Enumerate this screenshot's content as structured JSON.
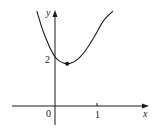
{
  "chart_data": {
    "type": "line",
    "title": "",
    "xlabel": "x",
    "ylabel": "y",
    "x_ticks": [
      {
        "value": 0,
        "label": "0"
      },
      {
        "value": 1,
        "label": "1"
      }
    ],
    "y_ticks": [
      {
        "value": 2,
        "label": "2"
      }
    ],
    "xlim": [
      -1.0,
      2.2
    ],
    "ylim": [
      -0.8,
      4.0
    ],
    "grid": false,
    "legend": null,
    "series": [
      {
        "name": "curve",
        "description": "Convex curve with a local minimum just right of the y-axis; y-intercept at 2",
        "x": [
          -0.43,
          -0.3,
          -0.2,
          -0.1,
          0.0,
          0.1,
          0.2,
          0.29,
          0.4,
          0.5,
          0.6,
          0.7,
          0.8,
          0.9,
          1.0,
          1.1,
          1.2,
          1.38
        ],
        "y": [
          3.95,
          3.2,
          2.75,
          2.35,
          2.05,
          1.88,
          1.79,
          1.76,
          1.8,
          1.9,
          2.05,
          2.25,
          2.5,
          2.78,
          3.08,
          3.4,
          3.65,
          3.95
        ]
      }
    ],
    "annotations": [
      {
        "type": "point",
        "x": 0.29,
        "y": 1.76,
        "label": "local minimum"
      }
    ]
  },
  "labels": {
    "x_axis": "x",
    "y_axis": "y",
    "origin": "0",
    "x_tick_1": "1",
    "y_tick_2": "2"
  }
}
